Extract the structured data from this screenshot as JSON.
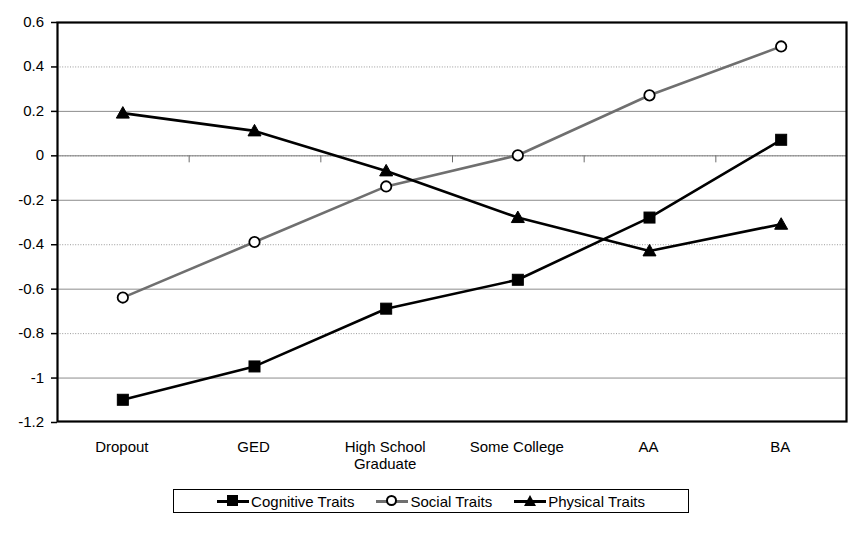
{
  "chart_data": {
    "type": "line",
    "title": "",
    "subtitle": "",
    "xlabel": "",
    "ylabel": "",
    "categories": [
      "Dropout",
      "GED",
      "High School Graduate",
      "Some College",
      "AA",
      "BA"
    ],
    "category_lines": [
      [
        "Dropout"
      ],
      [
        "GED"
      ],
      [
        "High School",
        "Graduate"
      ],
      [
        "Some College"
      ],
      [
        "AA"
      ],
      [
        "BA"
      ]
    ],
    "series": [
      {
        "name": "Cognitive Traits",
        "marker": "filled-square",
        "color": "#000000",
        "values": [
          -1.1,
          -0.95,
          -0.69,
          -0.56,
          -0.28,
          0.07
        ]
      },
      {
        "name": "Social Traits",
        "marker": "open-circle",
        "color": "#6f6f6f",
        "values": [
          -0.64,
          -0.39,
          -0.14,
          0.0,
          0.27,
          0.49
        ]
      },
      {
        "name": "Physical Traits",
        "marker": "filled-triangle",
        "color": "#000000",
        "values": [
          0.19,
          0.11,
          -0.07,
          -0.28,
          -0.43,
          -0.31
        ]
      }
    ],
    "ylim": [
      -1.2,
      0.6
    ],
    "yticks": [
      0.6,
      0.4,
      0.2,
      0,
      -0.2,
      -0.4,
      -0.6,
      -0.8,
      -1,
      -1.2
    ],
    "ytick_labels": [
      "0.6",
      "0.4",
      "0.2",
      "0",
      "-0.2",
      "-0.4",
      "-0.6",
      "-0.8",
      "-1",
      "-1.2"
    ],
    "grid": true,
    "grid_color": "#bdbdbd",
    "legend_position": "bottom",
    "plot_border_color": "#000000",
    "background_color": "#ffffff"
  },
  "legend": {
    "entries": [
      {
        "label": "Cognitive Traits"
      },
      {
        "label": "Social Traits"
      },
      {
        "label": "Physical Traits"
      }
    ]
  }
}
